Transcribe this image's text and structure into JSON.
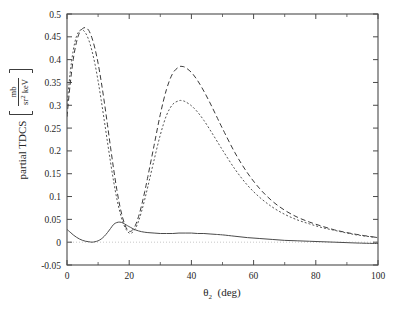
{
  "chart_data": {
    "type": "line",
    "title": "",
    "xlabel": "θ₂  (deg)",
    "ylabel": "partial TDCS",
    "ylabel_unit_numerator": "mb",
    "ylabel_unit_denominator": "sr² keV",
    "ylabel_full": "partial TDCS [mb/(sr² keV)]",
    "xlim": [
      0,
      100
    ],
    "ylim": [
      -0.05,
      0.5
    ],
    "xticks": [
      0,
      20,
      40,
      60,
      80,
      100
    ],
    "xtick_labels": [
      "0",
      "20",
      "40",
      "60",
      "80",
      "100"
    ],
    "yticks": [
      -0.05,
      0,
      0.05,
      0.1,
      0.15,
      0.2,
      0.25,
      0.3,
      0.35,
      0.4,
      0.45,
      0.5
    ],
    "ytick_labels": [
      "-0.05",
      "0",
      "0.05",
      "0.1",
      "0.15",
      "0.2",
      "0.25",
      "0.3",
      "0.35",
      "0.4",
      "0.45",
      "0.5"
    ],
    "grid": false,
    "legend": "none",
    "minor_ticks": true,
    "zero_reference_line": {
      "y": 0,
      "style": "dotted",
      "color": "#b9b9b9"
    },
    "series": [
      {
        "name": "long-dashed curve",
        "style": "dashed",
        "dasharray": "5,3",
        "color": "#3a3a3a",
        "x": [
          0,
          1,
          2,
          3,
          4,
          5,
          6,
          7,
          8,
          9,
          10,
          11,
          12,
          13,
          14,
          15,
          16,
          17,
          18,
          19,
          20,
          21,
          22,
          23,
          24,
          25,
          26,
          28,
          30,
          32,
          34,
          36,
          37,
          38,
          40,
          42,
          44,
          46,
          48,
          50,
          54,
          58,
          62,
          66,
          70,
          74,
          78,
          82,
          86,
          90,
          94,
          100
        ],
        "y": [
          0.275,
          0.345,
          0.4,
          0.437,
          0.459,
          0.468,
          0.47,
          0.464,
          0.448,
          0.424,
          0.392,
          0.352,
          0.307,
          0.258,
          0.208,
          0.16,
          0.116,
          0.079,
          0.051,
          0.032,
          0.024,
          0.026,
          0.037,
          0.056,
          0.081,
          0.111,
          0.144,
          0.212,
          0.28,
          0.335,
          0.37,
          0.384,
          0.385,
          0.383,
          0.372,
          0.354,
          0.331,
          0.305,
          0.277,
          0.249,
          0.196,
          0.152,
          0.117,
          0.09,
          0.07,
          0.055,
          0.044,
          0.035,
          0.027,
          0.021,
          0.016,
          0.01
        ]
      },
      {
        "name": "short-dotted curve",
        "style": "dotted",
        "dasharray": "2,2",
        "color": "#555555",
        "x": [
          0,
          1,
          2,
          3,
          4,
          5,
          6,
          7,
          8,
          9,
          10,
          11,
          12,
          13,
          14,
          15,
          16,
          17,
          18,
          19,
          20,
          21,
          22,
          23,
          24,
          25,
          26,
          28,
          30,
          32,
          34,
          36,
          37,
          38,
          40,
          42,
          44,
          46,
          48,
          50,
          54,
          58,
          62,
          66,
          70,
          74,
          78,
          82,
          86,
          90,
          94,
          100
        ],
        "y": [
          0.3,
          0.37,
          0.42,
          0.45,
          0.463,
          0.465,
          0.458,
          0.443,
          0.42,
          0.39,
          0.353,
          0.311,
          0.266,
          0.22,
          0.175,
          0.133,
          0.096,
          0.066,
          0.043,
          0.028,
          0.02,
          0.021,
          0.03,
          0.046,
          0.068,
          0.094,
          0.122,
          0.18,
          0.235,
          0.278,
          0.302,
          0.31,
          0.31,
          0.308,
          0.299,
          0.285,
          0.267,
          0.246,
          0.224,
          0.202,
          0.16,
          0.125,
          0.098,
          0.077,
          0.061,
          0.049,
          0.04,
          0.032,
          0.026,
          0.02,
          0.015,
          0.01
        ]
      },
      {
        "name": "solid curve",
        "style": "solid",
        "dasharray": "none",
        "color": "#4a4a4a",
        "x": [
          0,
          1,
          2,
          3,
          4,
          5,
          6,
          7,
          8,
          9,
          10,
          11,
          12,
          13,
          14,
          15,
          16,
          17,
          18,
          19,
          20,
          22,
          24,
          26,
          28,
          30,
          32,
          34,
          36,
          38,
          40,
          42,
          44,
          46,
          48,
          50,
          54,
          58,
          62,
          66,
          70,
          74,
          78,
          82,
          86,
          90,
          94,
          100
        ],
        "y": [
          0.028,
          0.022,
          0.016,
          0.011,
          0.007,
          0.004,
          0.002,
          0.001,
          0.0,
          0.001,
          0.003,
          0.007,
          0.013,
          0.021,
          0.03,
          0.039,
          0.043,
          0.044,
          0.042,
          0.038,
          0.034,
          0.027,
          0.023,
          0.021,
          0.02,
          0.019,
          0.019,
          0.019,
          0.02,
          0.02,
          0.02,
          0.019,
          0.019,
          0.018,
          0.017,
          0.016,
          0.013,
          0.01,
          0.008,
          0.006,
          0.004,
          0.003,
          0.002,
          0.001,
          0.0,
          -0.001,
          -0.002,
          -0.003
        ]
      }
    ]
  }
}
